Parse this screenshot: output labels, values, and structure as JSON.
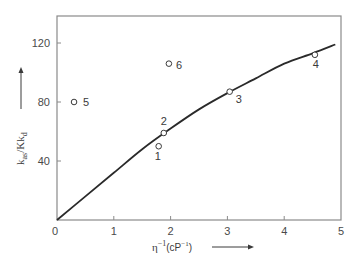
{
  "chart_data": {
    "type": "scatter",
    "title": "",
    "xlabel": "η⁻¹ (cP⁻¹)",
    "ylabel": "k_as / K k_d",
    "xlim": [
      0,
      5
    ],
    "ylim": [
      0,
      140
    ],
    "xticks": [
      0,
      1,
      2,
      3,
      4,
      5
    ],
    "yticks": [
      40,
      80,
      120
    ],
    "grid": false,
    "legend": null,
    "series": [
      {
        "name": "measured",
        "kind": "scatter",
        "marker": "open-circle",
        "points": [
          {
            "label": "1",
            "x": 1.79,
            "y": 50
          },
          {
            "label": "2",
            "x": 1.88,
            "y": 59
          },
          {
            "label": "3",
            "x": 3.04,
            "y": 87
          },
          {
            "label": "4",
            "x": 4.54,
            "y": 112
          },
          {
            "label": "5",
            "x": 0.3,
            "y": 80
          },
          {
            "label": "6",
            "x": 1.97,
            "y": 106
          }
        ]
      },
      {
        "name": "fit",
        "kind": "line",
        "points": [
          {
            "x": 0,
            "y": 0
          },
          {
            "x": 0.5,
            "y": 16
          },
          {
            "x": 1,
            "y": 32
          },
          {
            "x": 1.5,
            "y": 48
          },
          {
            "x": 2,
            "y": 62
          },
          {
            "x": 2.5,
            "y": 75
          },
          {
            "x": 3,
            "y": 86
          },
          {
            "x": 3.5,
            "y": 96
          },
          {
            "x": 4,
            "y": 106
          },
          {
            "x": 4.5,
            "y": 113
          },
          {
            "x": 4.9,
            "y": 119
          }
        ]
      }
    ]
  },
  "labels": {
    "x_axis": {
      "eta": "η",
      "sup": "−1",
      "unit": "(cP",
      "unit_sup": "−1",
      "close": ")"
    },
    "y_axis": {
      "k1": "k",
      "sub1": "as",
      "slash": "/",
      "K": "K",
      "k2": "k",
      "sub2": "d"
    }
  }
}
